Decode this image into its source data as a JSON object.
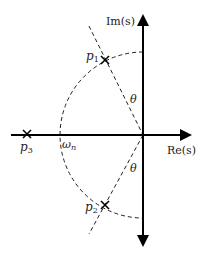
{
  "diagram": {
    "type": "s-plane pole diagram",
    "colors": {
      "axis": "#000000",
      "dashed": "#222222",
      "text": "#222222"
    },
    "axes": {
      "real_label": "Re(s)",
      "imag_label": "Im(s)"
    },
    "poles": [
      {
        "id": "p1",
        "label_main": "p",
        "label_sub": "1"
      },
      {
        "id": "p2",
        "label_main": "p",
        "label_sub": "2"
      },
      {
        "id": "p3",
        "label_main": "p",
        "label_sub": "3"
      }
    ],
    "angle_labels": {
      "upper": "θ",
      "lower": "θ"
    },
    "radius_label": {
      "main": "ω",
      "sub": "n"
    }
  }
}
